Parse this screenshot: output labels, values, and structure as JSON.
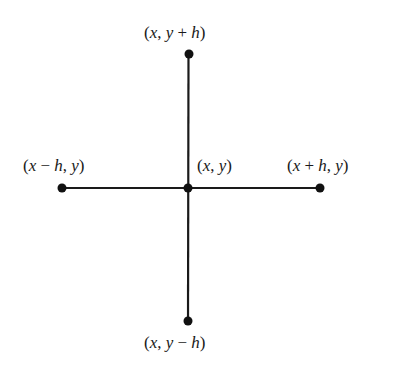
{
  "diagram": {
    "type": "five-point stencil",
    "colors": {
      "line": "#1a1a1a",
      "point": "#111111",
      "background": "#ffffff"
    },
    "nodes": [
      {
        "id": "center",
        "label": "(x, y)",
        "x": 188,
        "y": 188
      },
      {
        "id": "left",
        "label": "(x − h, y)",
        "x": 62,
        "y": 188
      },
      {
        "id": "right",
        "label": "(x + h, y)",
        "x": 320,
        "y": 188
      },
      {
        "id": "top",
        "label": "(x, y + h)",
        "x": 189,
        "y": 54
      },
      {
        "id": "bottom",
        "label": "(x, y − h)",
        "x": 188,
        "y": 321
      }
    ],
    "edges": [
      {
        "from": "left",
        "to": "right"
      },
      {
        "from": "top",
        "to": "bottom"
      }
    ],
    "labels": {
      "top": "(x, y + h)",
      "left": "(x − h, y)",
      "center": "(x, y)",
      "right": "(x + h, y)",
      "bottom": "(x, y − h)"
    }
  }
}
